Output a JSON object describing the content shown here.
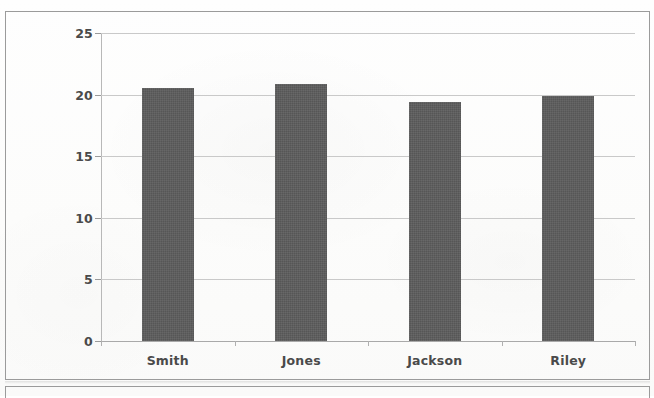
{
  "chart_data": {
    "type": "bar",
    "title": "",
    "subtitle": "",
    "xlabel": "",
    "ylabel": "",
    "categories": [
      "Smith",
      "Jones",
      "Jackson",
      "Riley"
    ],
    "values": [
      20.5,
      20.9,
      19.4,
      19.9
    ],
    "series": [
      {
        "name": "Series 1",
        "values": [
          20.5,
          20.9,
          19.4,
          19.9
        ],
        "color": "#565656"
      }
    ],
    "ylim": [
      0,
      25
    ],
    "xlim": [
      0,
      4
    ],
    "y_ticks": [
      0,
      5,
      10,
      15,
      20,
      25
    ],
    "y_tick_labels": [
      "0",
      "5",
      "10",
      "15",
      "20",
      "25"
    ],
    "grid": "horizontal",
    "legend": "none",
    "annotations": [],
    "colors": {
      "bar_fill": "#565656",
      "gridline": "#c9c9c9",
      "axis_line": "#b8b8b8",
      "tick_text": "#4a4a4a",
      "panel_border": "#9b9b9b",
      "background": "#fdfdfc"
    }
  },
  "panels": {
    "chart_panel_label": "bar chart panel",
    "lower_panel_label": "following figure panel"
  }
}
